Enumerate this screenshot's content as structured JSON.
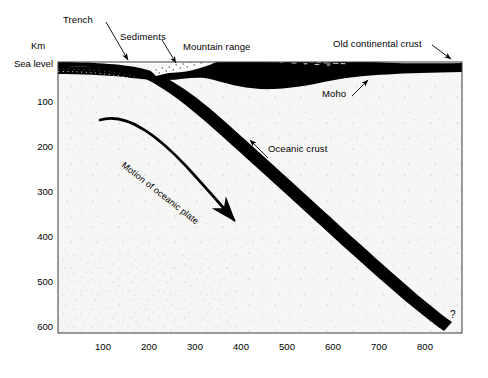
{
  "figure": {
    "type": "cross-section-diagram"
  },
  "axes": {
    "y_axis_unit_label": "Km",
    "y_axis_top_label": "Sea level",
    "y_ticks": [
      "100",
      "200",
      "300",
      "400",
      "500",
      "600"
    ],
    "y_min_km": 0,
    "y_max_km": 600,
    "x_ticks": [
      "100",
      "200",
      "300",
      "400",
      "500",
      "600",
      "700",
      "800"
    ],
    "x_min_km": 0,
    "x_max_km": 870,
    "x_axis_unit": "Km"
  },
  "labels": {
    "trench": "Trench",
    "sediments": "Sediments",
    "mountain_range": "Mountain range",
    "old_continental_crust": "Old continental crust",
    "moho": "Moho",
    "oceanic_crust": "Oceanic crust",
    "motion_of_oceanic_plate": "Motion of oceanic plate",
    "uncertain_marker": "?"
  },
  "features": {
    "trench_position_km": 175,
    "mountain_range_peak_km": 330,
    "slab_termination_km": 855,
    "slab_termination_depth_km": 560,
    "slab_dip_degrees": 35
  },
  "colors": {
    "crust": "#000000",
    "mantle": "#f4f4f2",
    "frame": "#3a3a3a",
    "text": "#000000"
  }
}
